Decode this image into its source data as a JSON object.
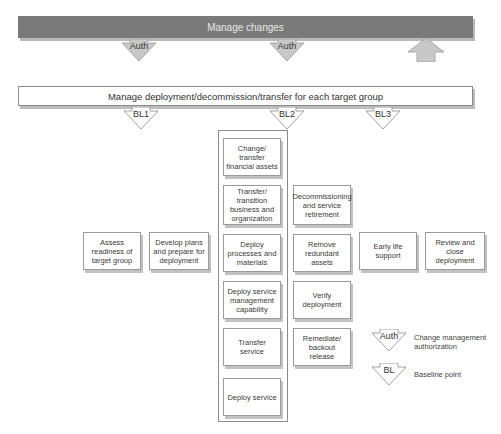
{
  "top_bar": {
    "label": "Manage changes"
  },
  "auth_arrows": [
    {
      "label": "Auth",
      "direction": "down"
    },
    {
      "label": "Auth",
      "direction": "down"
    },
    {
      "label": "",
      "direction": "up"
    }
  ],
  "mid_bar": {
    "label": "Manage deployment/decommission/transfer for each target group"
  },
  "baseline_arrows": [
    {
      "label": "BL1"
    },
    {
      "label": "BL2"
    },
    {
      "label": "BL3"
    }
  ],
  "left_boxes": [
    {
      "label": "Assess readiness of target group"
    },
    {
      "label": "Develop plans and prepare for deployment"
    }
  ],
  "center_column": [
    {
      "label": "Change/ transfer financial assets"
    },
    {
      "label": "Transfer/ transition business and organization"
    },
    {
      "label": "Deploy processes and materials"
    },
    {
      "label": "Deploy service management capability"
    },
    {
      "label": "Transfer service"
    },
    {
      "label": "Deploy service"
    }
  ],
  "right_column": [
    {
      "label": "Decommissioning and service retirement"
    },
    {
      "label": "Remove redundant assets"
    },
    {
      "label": "Verify deployment"
    },
    {
      "label": "Remediate/ backout release"
    }
  ],
  "right_boxes": [
    {
      "label": "Early life support"
    },
    {
      "label": "Review and close deployment"
    }
  ],
  "legend": [
    {
      "symbol": "Auth",
      "description": "Change management authorization"
    },
    {
      "symbol": "BL",
      "description": "Baseline point"
    }
  ],
  "colors": {
    "dark_bar": "#7a7a7a",
    "dark_arrow_fill": "#c8c8c8",
    "light_arrow_fill": "#ffffff",
    "border": "#8a8a8a"
  }
}
